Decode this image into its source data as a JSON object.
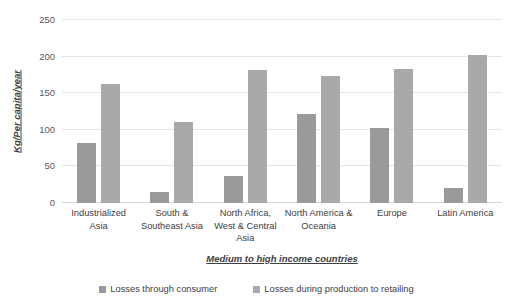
{
  "chart_data": {
    "type": "bar",
    "title": "",
    "subtitle": "",
    "xlabel": "Medium to high income countries",
    "ylabel": "Kg/Per capita/year",
    "ylim": [
      0,
      250
    ],
    "yticks": [
      0,
      50,
      100,
      150,
      200,
      250
    ],
    "ytick_labels": [
      "0",
      "50",
      "100",
      "150",
      "200",
      "250"
    ],
    "grid": "horizontal",
    "legend_position": "bottom",
    "categories": [
      "Industrialized Asia",
      "South & Southeast Asia",
      "North Africa, West & Central Asia",
      "North America & Oceania",
      "Europe",
      "Latin America"
    ],
    "category_lines": [
      [
        "Industrialized",
        "Asia"
      ],
      [
        "South &",
        "Southeast Asia"
      ],
      [
        "North Africa,",
        "West & Central",
        "Asia"
      ],
      [
        "North America &",
        "Oceania"
      ],
      [
        "Europe"
      ],
      [
        "Latin America"
      ]
    ],
    "series": [
      {
        "name": "Losses through consumer",
        "color": "#9a9a9a",
        "values": [
          82,
          15,
          37,
          122,
          103,
          21
        ]
      },
      {
        "name": "Losses during production to retailing",
        "color": "#a9a9a9",
        "values": [
          163,
          111,
          182,
          173,
          183,
          202
        ]
      }
    ]
  },
  "colors": {
    "gridline": "#e4e4e4",
    "baseline": "#d9d9d9",
    "text": "#404040",
    "tick_text": "#595959",
    "background": "#ffffff"
  }
}
